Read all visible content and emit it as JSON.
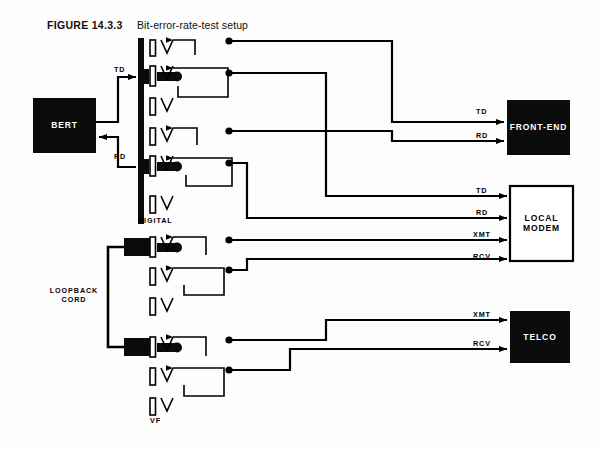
{
  "figure": {
    "number": "FIGURE 14.3.3",
    "title": "Bit-error-rate-test setup"
  },
  "blocks": [
    {
      "id": "bert",
      "label": "BERT",
      "style": "filled"
    },
    {
      "id": "front_end",
      "label": "FRONT-END",
      "style": "filled"
    },
    {
      "id": "local_modem",
      "label": "LOCAL\nMODEM",
      "style": "outline"
    },
    {
      "id": "telco",
      "label": "TELCO",
      "style": "filled"
    }
  ],
  "panels": [
    {
      "id": "digital",
      "caption": "DIGITAL"
    },
    {
      "id": "vf",
      "caption": "VF"
    }
  ],
  "cord": {
    "caption": "LOOPBACK\nCORD"
  },
  "signals": {
    "bert_td": "TD",
    "bert_rd": "RD",
    "front_end_td": "TD",
    "front_end_rd": "RD",
    "modem_td": "TD",
    "modem_rd": "RD",
    "modem_xmt": "XMT",
    "modem_rcv": "RCV",
    "telco_xmt": "XMT",
    "telco_rcv": "RCV"
  },
  "colors": {
    "ink": "#000000",
    "paper": "#fdfdfd",
    "block_fill": "#0b0b0b",
    "block_text_light": "#ffffff"
  }
}
